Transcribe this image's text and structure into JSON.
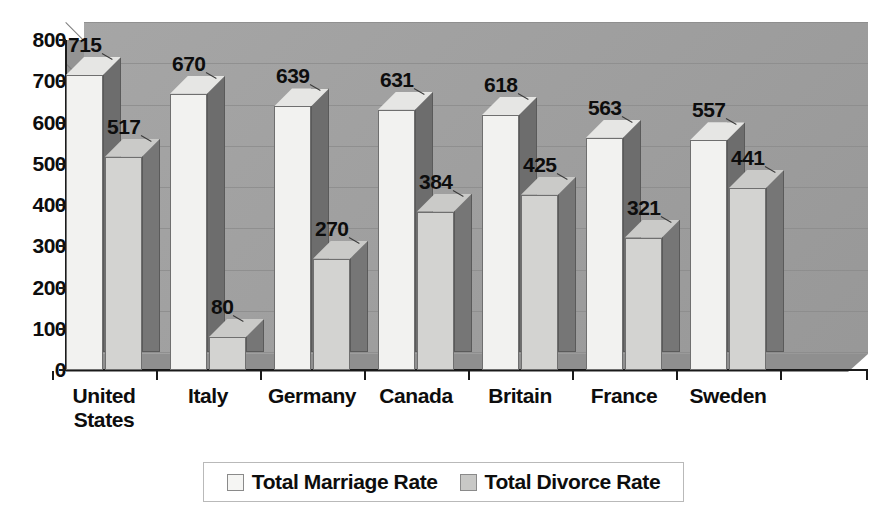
{
  "chart_data": {
    "type": "bar",
    "title": "",
    "subtitle": "",
    "xlabel": "",
    "ylabel": "",
    "categories": [
      "United States",
      "Italy",
      "Germany",
      "Canada",
      "Britain",
      "France",
      "Sweden"
    ],
    "series": [
      {
        "name": "Total Marriage Rate",
        "values": [
          715,
          670,
          639,
          631,
          618,
          563,
          557
        ],
        "color": "#f2f2f0"
      },
      {
        "name": "Total Divorce Rate",
        "values": [
          517,
          80,
          270,
          384,
          425,
          321,
          441
        ],
        "color": "#d3d3d1"
      }
    ],
    "ylim": [
      0,
      800
    ],
    "ytick_step": 100,
    "ytick_labels": [
      "800",
      "700",
      "600",
      "500",
      "400",
      "300",
      "200",
      "100",
      "0"
    ],
    "grid": true,
    "legend_position": "bottom",
    "style": "3d-column-grayscale",
    "plot_background": "#a0a0a0"
  },
  "axis": {
    "y_ticks": [
      {
        "label": "800",
        "value": 800
      },
      {
        "label": "700",
        "value": 700
      },
      {
        "label": "600",
        "value": 600
      },
      {
        "label": "500",
        "value": 500
      },
      {
        "label": "400",
        "value": 400
      },
      {
        "label": "300",
        "value": 300
      },
      {
        "label": "200",
        "value": 200
      },
      {
        "label": "100",
        "value": 100
      },
      {
        "label": "0",
        "value": 0
      }
    ]
  },
  "categories": [
    {
      "label": "United\nStates",
      "marriage": "715",
      "divorce": "517"
    },
    {
      "label": "Italy",
      "marriage": "670",
      "divorce": "80"
    },
    {
      "label": "Germany",
      "marriage": "639",
      "divorce": "270"
    },
    {
      "label": "Canada",
      "marriage": "631",
      "divorce": "384"
    },
    {
      "label": "Britain",
      "marriage": "618",
      "divorce": "425"
    },
    {
      "label": "France",
      "marriage": "563",
      "divorce": "321"
    },
    {
      "label": "Sweden",
      "marriage": "557",
      "divorce": "441"
    }
  ],
  "legend": {
    "entries": [
      {
        "label": "Total Marriage Rate",
        "color": "#f2f2f0"
      },
      {
        "label": "Total Divorce Rate",
        "color": "#c8c8c6"
      }
    ]
  }
}
